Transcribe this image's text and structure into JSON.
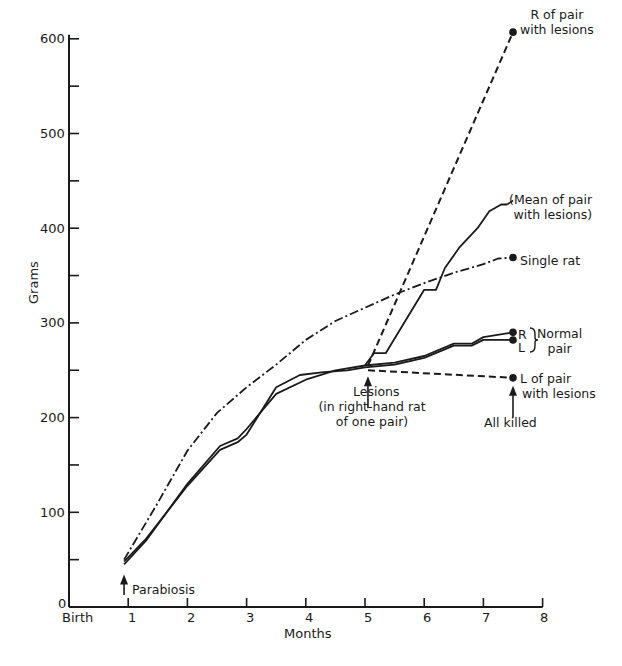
{
  "chart_data": {
    "type": "line",
    "title": "",
    "xlabel": "Months",
    "ylabel": "Grams",
    "xlim": [
      0,
      8
    ],
    "ylim": [
      0,
      600
    ],
    "grid": false,
    "x_ticks": [
      {
        "value": 0,
        "label": "Birth"
      },
      {
        "value": 1,
        "label": "1"
      },
      {
        "value": 2,
        "label": "2"
      },
      {
        "value": 3,
        "label": "3"
      },
      {
        "value": 4,
        "label": "4"
      },
      {
        "value": 5,
        "label": "5"
      },
      {
        "value": 6,
        "label": "6"
      },
      {
        "value": 7,
        "label": "7"
      },
      {
        "value": 8,
        "label": "8"
      }
    ],
    "y_ticks": [
      {
        "value": 0,
        "label": "0"
      },
      {
        "value": 100,
        "label": "100"
      },
      {
        "value": 200,
        "label": "200"
      },
      {
        "value": 300,
        "label": "300"
      },
      {
        "value": 400,
        "label": "400"
      },
      {
        "value": 500,
        "label": "500"
      },
      {
        "value": 600,
        "label": "600"
      }
    ],
    "y_minor_ticks": [
      50,
      150,
      250,
      350,
      450,
      550
    ],
    "series": [
      {
        "name": "Single rat",
        "style": "dash-dot",
        "endpoint_marker": true,
        "x": [
          0.93,
          1.5,
          2.0,
          2.5,
          3.0,
          3.5,
          4.0,
          4.5,
          5.0,
          5.5,
          6.0,
          6.5,
          7.0,
          7.25,
          7.5
        ],
        "y": [
          50,
          110,
          165,
          205,
          232,
          256,
          282,
          302,
          316,
          330,
          342,
          353,
          362,
          368,
          369
        ]
      },
      {
        "name": "Normal pair R",
        "style": "solid",
        "endpoint_marker": true,
        "x": [
          0.93,
          1.3,
          2.0,
          2.55,
          2.85,
          3.0,
          3.5,
          4.0,
          4.5,
          5.0,
          5.5,
          6.0,
          6.5,
          6.8,
          7.0,
          7.5
        ],
        "y": [
          45,
          70,
          130,
          170,
          178,
          188,
          225,
          240,
          250,
          255,
          258,
          265,
          278,
          278,
          285,
          290
        ]
      },
      {
        "name": "Normal pair L",
        "style": "solid",
        "endpoint_marker": true,
        "x": [
          0.93,
          1.3,
          2.0,
          2.55,
          2.85,
          3.0,
          3.5,
          3.9,
          4.3,
          4.7,
          5.0,
          5.5,
          6.0,
          6.5,
          6.8,
          7.0,
          7.5
        ],
        "y": [
          48,
          72,
          128,
          166,
          174,
          182,
          232,
          245,
          248,
          250,
          253,
          256,
          263,
          276,
          276,
          282,
          282
        ]
      },
      {
        "name": "Mean of pair with lesions",
        "style": "solid",
        "endpoint_marker": false,
        "x": [
          5.0,
          5.15,
          5.35,
          6.0,
          6.2,
          6.35,
          6.6,
          6.9,
          7.1,
          7.3,
          7.4
        ],
        "y": [
          255,
          268,
          268,
          335,
          335,
          358,
          380,
          400,
          418,
          425,
          425
        ]
      },
      {
        "name": "R of pair with lesions",
        "style": "dashed",
        "endpoint_marker": true,
        "x": [
          5.05,
          7.5
        ],
        "y": [
          255,
          607
        ]
      },
      {
        "name": "L of pair with lesions",
        "style": "dashed",
        "endpoint_marker": true,
        "x": [
          5.05,
          7.5
        ],
        "y": [
          250,
          242
        ]
      }
    ],
    "annotations": [
      {
        "id": "r_lesions",
        "lines": [
          "R of pair",
          "with lesions"
        ],
        "x": 7.6,
        "y": 607
      },
      {
        "id": "mean_lesions",
        "lines": [
          "(Mean of pair",
          "with lesions)"
        ],
        "x": 7.4,
        "y": 425
      },
      {
        "id": "single_rat",
        "lines": [
          "Single rat"
        ],
        "x": 7.6,
        "y": 369
      },
      {
        "id": "normal_pair",
        "lines": [
          "R",
          "L"
        ],
        "brace_label": [
          "Normal",
          "pair"
        ],
        "x": 7.6,
        "y": 286
      },
      {
        "id": "l_lesions",
        "lines": [
          "L of pair",
          "with lesions"
        ],
        "x": 7.6,
        "y": 242
      },
      {
        "id": "all_killed",
        "lines": [
          "All killed"
        ],
        "arrow_at": {
          "x": 7.5,
          "y": 230
        }
      },
      {
        "id": "lesions",
        "lines": [
          "Lesions",
          "(in right-hand rat",
          "of one pair)"
        ],
        "arrow_at": {
          "x": 5.05,
          "y": 250
        }
      },
      {
        "id": "parabiosis",
        "lines": [
          "Parabiosis"
        ],
        "arrow_at": {
          "x": 0.93,
          "y": 45
        }
      }
    ]
  }
}
